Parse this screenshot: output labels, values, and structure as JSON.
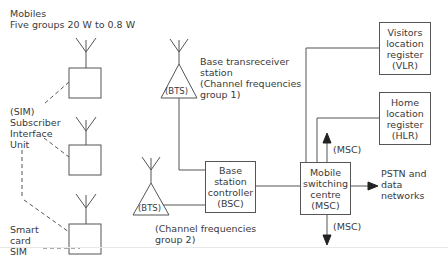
{
  "diagram": {
    "title_line1": "Mobiles",
    "title_line2": "Five groups 20 W to 0.8 W",
    "sim_label": [
      "(SIM)",
      "Subscriber",
      "Interface",
      "Unit"
    ],
    "smart_card_label": [
      "Smart",
      "card",
      "SIM"
    ],
    "bts1": {
      "label": "(BTS)",
      "caption": [
        "Base transreceiver",
        "station",
        "(Channel frequencies",
        "group 1)"
      ]
    },
    "bts2": {
      "label": "(BTS)",
      "caption": [
        "(Channel frequencies",
        "group 2)"
      ]
    },
    "bsc": {
      "lines": [
        "Base",
        "station",
        "controller",
        "(BSC)"
      ]
    },
    "msc": {
      "lines": [
        "Mobile",
        "switching",
        "centre",
        "(MSC)"
      ]
    },
    "vlr": {
      "lines": [
        "Visitors",
        "location",
        "register",
        "(VLR)"
      ]
    },
    "hlr": {
      "lines": [
        "Home",
        "location",
        "register",
        "(HLR)"
      ]
    },
    "msc_up_label": "(MSC)",
    "msc_down_label": "(MSC)",
    "pstn": [
      "PSTN and",
      "data",
      "networks"
    ],
    "line_color": "#555555"
  }
}
